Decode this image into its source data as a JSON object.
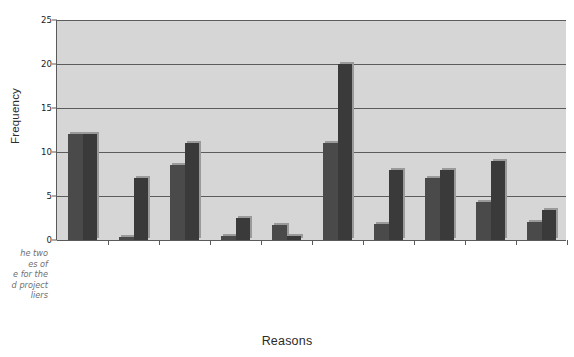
{
  "caption": {
    "text": "he two\nes of\ne for the\nd project\nliers"
  },
  "chart_data": {
    "type": "bar",
    "title": "",
    "xlabel": "Reasons",
    "ylabel": "Frequency",
    "ylim": [
      0,
      25
    ],
    "yticks": [
      0,
      5,
      10,
      15,
      20,
      25
    ],
    "grid": true,
    "legend": "none",
    "plot_background": "#d6d6d6",
    "categories": [
      "Bearing longer term\nliabilities",
      "Tightening the time-scale for\ndelivering products/services",
      "Being responsible for\nwider scope of activities",
      "Delivering contracts of\nhigher value",
      "Delivering services of\nhigher value",
      "Bearing larger or new risks",
      "Having larger reward\nopportunities",
      "Working with new\nalliances/partners",
      "Delivering holistically\nfocused solutions",
      "Others"
    ],
    "series": [
      {
        "name": "Series 1",
        "color": "#4a4a4a",
        "values": [
          12,
          0.3,
          8.5,
          0.5,
          1.7,
          11,
          1.8,
          7,
          4.3,
          2
        ]
      },
      {
        "name": "Series 2",
        "color": "#3a3a3a",
        "values": [
          12,
          7,
          11,
          2.5,
          0.4,
          20,
          8,
          8,
          9,
          3.4
        ]
      }
    ]
  }
}
